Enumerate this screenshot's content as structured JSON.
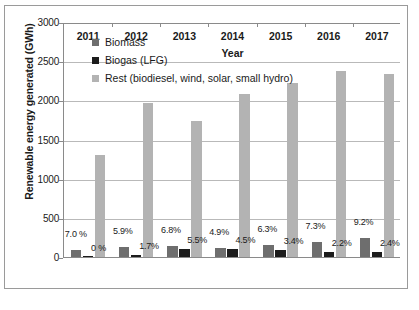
{
  "chart_data": {
    "type": "bar",
    "title": "",
    "xlabel": "Year",
    "ylabel": "Renewable energy generated (GWh)",
    "categories": [
      "2011",
      "2012",
      "2013",
      "2014",
      "2015",
      "2016",
      "2017"
    ],
    "ylim": [
      0,
      3000
    ],
    "yticks": [
      "0",
      "500",
      "1000",
      "1500",
      "2000",
      "2500",
      "3000"
    ],
    "grid": true,
    "legend_position": "upper-left inside plot",
    "series": [
      {
        "name": "Biomass",
        "color": "#6e6e6e",
        "values": [
          95,
          130,
          135,
          120,
          155,
          190,
          245
        ],
        "labels": [
          "7.0 %",
          "5.9%",
          "6.8%",
          "4.9%",
          "6.3%",
          "7.3%",
          "9.2%"
        ]
      },
      {
        "name": "Biogas (LFG)",
        "color": "#1c1c1c",
        "values": [
          5,
          30,
          100,
          100,
          85,
          60,
          70
        ],
        "labels": [
          "0 %",
          "1.7%",
          "5.5%",
          "4.5%",
          "3.4%",
          "2.2%",
          "2.4%"
        ]
      },
      {
        "name": "Rest (biodiesel, wind, solar, small hydro)",
        "color": "#b3b3b3",
        "values": [
          1300,
          1970,
          1740,
          2080,
          2220,
          2380,
          2340
        ],
        "labels": [
          "",
          "",
          "",
          "",
          "",
          "",
          ""
        ]
      }
    ]
  },
  "legend": {
    "items": [
      {
        "label": "Biomass",
        "color": "#6e6e6e"
      },
      {
        "label": "Biogas (LFG)",
        "color": "#1c1c1c"
      },
      {
        "label": "Rest (biodiesel, wind, solar, small hydro)",
        "color": "#b3b3b3"
      }
    ]
  },
  "axes": {
    "y_title": "Renewable energy generated (GWh)",
    "x_title": "Year"
  },
  "colors": {
    "biomass": "#6e6e6e",
    "biogas": "#1c1c1c",
    "rest": "#b3b3b3",
    "gridline": "#b9b9b9",
    "axis": "#8a8a8a",
    "frame": "#9a9a9a"
  }
}
